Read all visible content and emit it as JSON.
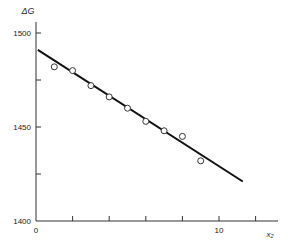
{
  "chart_data": {
    "type": "scatter",
    "title": "",
    "xlabel": "x₂",
    "ylabel": "ΔG",
    "xlim": [
      0,
      13
    ],
    "ylim": [
      1400,
      1500
    ],
    "x_ticks": [
      0,
      2,
      4,
      6,
      8,
      10,
      12
    ],
    "x_tick_labels": [
      "0",
      "",
      "",
      "",
      "",
      "10",
      ""
    ],
    "y_ticks": [
      1400,
      1425,
      1450,
      1475,
      1500
    ],
    "y_tick_labels": [
      "1400",
      "",
      "1450",
      "",
      "1500"
    ],
    "grid": false,
    "legend": null,
    "series": [
      {
        "name": "data",
        "marker": "open-circle",
        "x": [
          1,
          2,
          3,
          4,
          5,
          6,
          7,
          8,
          9
        ],
        "y": [
          1482,
          1480,
          1472,
          1466,
          1460,
          1453,
          1448,
          1445,
          1432
        ]
      },
      {
        "name": "fit",
        "type": "line",
        "x": [
          0.1,
          11.3
        ],
        "y": [
          1491,
          1421
        ]
      }
    ]
  },
  "axes": {
    "xlabel": "x₂",
    "ylabel": "ΔG"
  }
}
